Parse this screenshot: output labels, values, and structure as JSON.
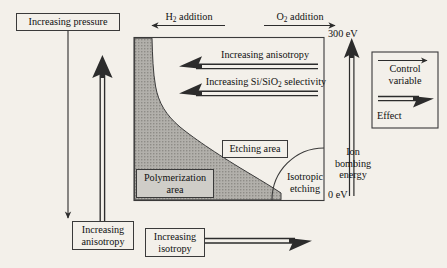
{
  "diagram": {
    "axes": {
      "vertical_axis_label": "Ion bombing energy",
      "top_value": "300 eV",
      "bottom_value": "0 eV"
    },
    "top_controls": [
      {
        "id": "h2",
        "label_html": "H<sub>2</sub> addition",
        "label": "H2 addition",
        "arrow": "thin-left"
      },
      {
        "id": "o2",
        "label_html": "O<sub>2</sub> addition",
        "label": "O2 addition",
        "arrow": "thin-right"
      }
    ],
    "left_controls": [
      {
        "id": "pressure",
        "label": "Increasing pressure",
        "arrow": "thin-down"
      },
      {
        "id": "anisotropy",
        "label_line1": "Increasing",
        "label_line2": "anisotropy",
        "label": "Increasing anisotropy",
        "arrow": "thick-up"
      }
    ],
    "bottom_controls": [
      {
        "id": "isotropy",
        "label_line1": "Increasing",
        "label_line2": "isotropy",
        "label": "Increasing isotropy",
        "arrow": "thick-right"
      }
    ],
    "inner_effects": [
      {
        "id": "anisotropy-effect",
        "label": "Increasing anisotropy",
        "arrow": "thick-left"
      },
      {
        "id": "selectivity-effect",
        "label_html": "Increasing Si/SiO<sub>2</sub> selectivity",
        "label": "Increasing Si/SiO2 selectivity",
        "arrow": "thick-left"
      }
    ],
    "regions": [
      {
        "id": "polymerization",
        "label_line1": "Polymerization",
        "label_line2": "area",
        "label": "Polymerization area",
        "fill": "#a9a7a2",
        "boxed": true
      },
      {
        "id": "etching",
        "label": "Etching area",
        "fill": "#f3f0ea",
        "boxed": true
      },
      {
        "id": "isotropic",
        "label_line1": "Isotropic",
        "label_line2": "etching",
        "label": "Isotropic etching",
        "fill": "#f3f0ea",
        "boxed": false
      }
    ],
    "legend": {
      "control_variable_line1": "Control",
      "control_variable_line2": "variable",
      "control_variable": "Control variable",
      "effect": "Effect"
    },
    "colors": {
      "background": "#f3f0ea",
      "line": "#3a3a3a",
      "polymerization_fill": "#a9a7a2",
      "label_shaded": "#cfcdc8"
    }
  }
}
